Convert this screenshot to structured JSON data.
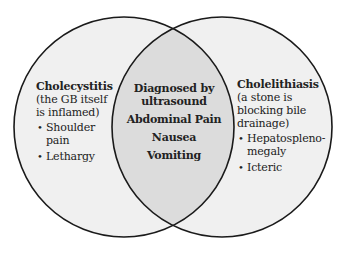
{
  "diagram": {
    "type": "venn",
    "colors": {
      "outline": "#1a1a1a",
      "outer_fill": "#f0f0f0",
      "overlap_fill": "#dcdcdc",
      "text": "#222222"
    },
    "left": {
      "title": "Cholecystitis",
      "subtitle_lines": [
        "(the GB itself",
        "is inflamed)"
      ],
      "bullets": [
        {
          "lines": [
            "Shoulder",
            "pain"
          ]
        },
        {
          "lines": [
            "Lethargy"
          ]
        }
      ]
    },
    "overlap": {
      "lines": [
        "Diagnosed by",
        "ultrasound",
        "Abdominal Pain",
        "Nausea",
        "Vomiting"
      ]
    },
    "right": {
      "title": "Cholelithiasis",
      "subtitle_lines": [
        "(a stone is",
        "blocking bile",
        "drainage)"
      ],
      "bullets": [
        {
          "lines": [
            "Hepatospleno-",
            "megaly"
          ]
        },
        {
          "lines": [
            "Icteric"
          ]
        }
      ]
    }
  }
}
